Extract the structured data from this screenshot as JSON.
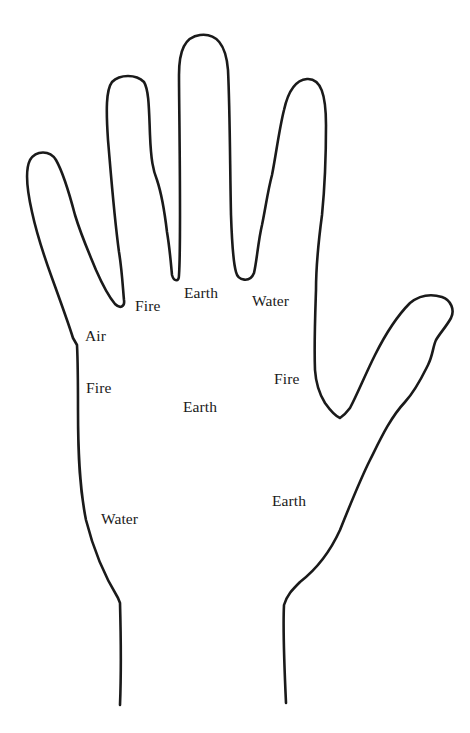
{
  "diagram": {
    "type": "palmistry-hand-element-map",
    "colors": {
      "background": "#ffffff",
      "outline": "#1a1a1a",
      "text": "#1a1a1a"
    },
    "labels": [
      {
        "id": "index-base",
        "text": "Fire",
        "x": 135,
        "y": 298,
        "region": "base of index finger"
      },
      {
        "id": "middle-base",
        "text": "Earth",
        "x": 184,
        "y": 285,
        "region": "base of middle finger"
      },
      {
        "id": "ring-base",
        "text": "Water",
        "x": 252,
        "y": 293,
        "region": "base of ring finger"
      },
      {
        "id": "little-base",
        "text": "Air",
        "x": 85,
        "y": 328,
        "region": "base of little finger"
      },
      {
        "id": "upper-outer-palm",
        "text": "Fire",
        "x": 86,
        "y": 380,
        "region": "upper outer palm"
      },
      {
        "id": "palm-center",
        "text": "Earth",
        "x": 183,
        "y": 399,
        "region": "center of palm"
      },
      {
        "id": "thumb-side",
        "text": "Fire",
        "x": 274,
        "y": 371,
        "region": "thumb side"
      },
      {
        "id": "lower-outer-palm",
        "text": "Water",
        "x": 101,
        "y": 511,
        "region": "lower outer palm"
      },
      {
        "id": "thumb-mount",
        "text": "Earth",
        "x": 272,
        "y": 493,
        "region": "mount of thumb"
      }
    ]
  }
}
